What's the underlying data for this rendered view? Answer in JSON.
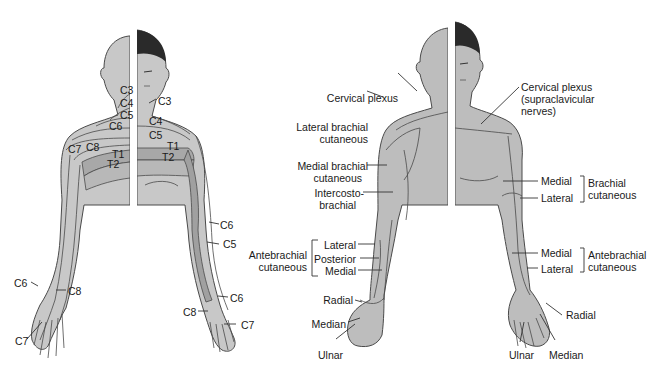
{
  "colors": {
    "skin_light": "#c8c8c8",
    "skin_mid": "#b4b4b4",
    "skin_dark": "#a0a0a0",
    "outline": "#4a4a4a",
    "hair": "#2a2a2a",
    "background": "#ffffff"
  },
  "left_figure": {
    "title": "Dermatomes",
    "labels": {
      "c3_back": "C3",
      "c4_back": "C4",
      "c5_back": "C5",
      "c6_back": "C6",
      "c7_back": "C7",
      "c8_back": "C8",
      "t1_back": "T1",
      "t2_back": "T2",
      "c3_front": "C3",
      "c4_front": "C4",
      "c5_front": "C5",
      "t1_front": "T1",
      "t2_front": "T2",
      "c6_arm_upper": "C6",
      "c5_arm": "C5",
      "c6_wrist_right": "C6",
      "c8_hand_right": "C8",
      "c7_hand_right": "C7",
      "c6_hand_left": "C6",
      "c8_hand_left": "C8",
      "c7_hand_left": "C7"
    }
  },
  "right_figure": {
    "title": "Cutaneous nerves",
    "labels": {
      "cervical_plexus": "Cervical plexus",
      "cervical_plexus_supra_1": "Cervical plexus",
      "cervical_plexus_supra_2": "(supraclavicular",
      "cervical_plexus_supra_3": "nerves)",
      "lateral_brachial_1": "Lateral brachial",
      "lateral_brachial_2": "cutaneous",
      "medial_brachial_1": "Medial brachial",
      "medial_brachial_2": "cutaneous",
      "intercosto_1": "Intercosto-",
      "intercosto_2": "brachial",
      "antebrachial_group_1": "Antebrachial",
      "antebrachial_group_2": "cutaneous",
      "ante_lateral": "Lateral",
      "ante_posterior": "Posterior",
      "ante_medial": "Medial",
      "radial_back": "Radial",
      "median_back": "Median",
      "ulnar_back": "Ulnar",
      "brachial_medial": "Medial",
      "brachial_lateral": "Lateral",
      "brachial_group_1": "Brachial",
      "brachial_group_2": "cutaneous",
      "ante_front_medial": "Medial",
      "ante_front_lateral": "Lateral",
      "ante_front_group_1": "Antebrachial",
      "ante_front_group_2": "cutaneous",
      "radial_front": "Radial",
      "ulnar_front": "Ulnar",
      "median_front": "Median"
    }
  }
}
